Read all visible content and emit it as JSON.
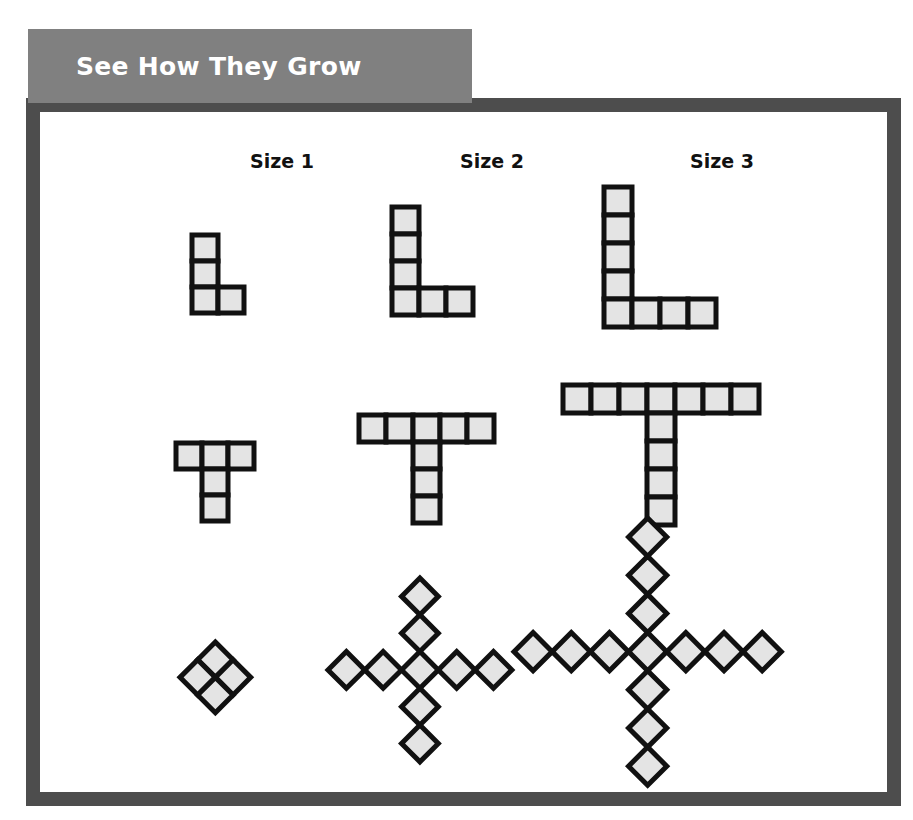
{
  "banner": {
    "title": "See How They Grow",
    "bg_color": "#808080",
    "text_color": "#ffffff"
  },
  "frame": {
    "border_color": "#4d4d4d",
    "background": "#ffffff"
  },
  "columns": [
    {
      "label": "Size 1",
      "center_x": 222
    },
    {
      "label": "Size 2",
      "center_x": 432
    },
    {
      "label": "Size 3",
      "center_x": 662
    }
  ],
  "style": {
    "cell_fill": "#e4e4e4",
    "cell_stroke": "#111111"
  },
  "chart_data": {
    "type": "diagram",
    "title": "See How They Grow",
    "columns": [
      "Size 1",
      "Size 2",
      "Size 3"
    ],
    "rows": [
      {
        "name": "L-shape",
        "rule": "vertical arm of (size+2) squares, horizontal base of (size+1) squares, sharing the corner square",
        "figures": [
          {
            "size": 1,
            "vertical_arm": 3,
            "horizontal_arm": 2,
            "total_cells": 4
          },
          {
            "size": 2,
            "vertical_arm": 4,
            "horizontal_arm": 3,
            "total_cells": 6
          },
          {
            "size": 3,
            "vertical_arm": 5,
            "horizontal_arm": 4,
            "total_cells": 8
          }
        ]
      },
      {
        "name": "T-shape",
        "rule": "top bar of (2*size+1) squares with a stem of (size+1) squares hanging from the center",
        "figures": [
          {
            "size": 1,
            "top_bar": 3,
            "stem": 2,
            "total_cells": 5
          },
          {
            "size": 2,
            "top_bar": 5,
            "stem": 3,
            "total_cells": 8
          },
          {
            "size": 3,
            "top_bar": 7,
            "stem": 4,
            "total_cells": 11
          }
        ]
      },
      {
        "name": "X-shape",
        "rule": "diagonal cross of tilted squares; size 1 is a 2x2 block, larger sizes are a center square with four arms of (size) squares",
        "figures": [
          {
            "size": 1,
            "arms": 0,
            "total_cells": 4
          },
          {
            "size": 2,
            "arms": 2,
            "total_cells": 9
          },
          {
            "size": 3,
            "arms": 3,
            "total_cells": 13
          }
        ]
      }
    ]
  },
  "shapes": {
    "l_shapes": [
      {
        "name": "l-shape-size-1",
        "origin_x": 192,
        "origin_y": 235,
        "cell": 26,
        "cells": [
          [
            0,
            0
          ],
          [
            0,
            1
          ],
          [
            0,
            2
          ],
          [
            1,
            2
          ]
        ]
      },
      {
        "name": "l-shape-size-2",
        "origin_x": 392,
        "origin_y": 207,
        "cell": 27,
        "cells": [
          [
            0,
            0
          ],
          [
            0,
            1
          ],
          [
            0,
            2
          ],
          [
            0,
            3
          ],
          [
            1,
            3
          ],
          [
            2,
            3
          ]
        ]
      },
      {
        "name": "l-shape-size-3",
        "origin_x": 604,
        "origin_y": 187,
        "cell": 28,
        "cells": [
          [
            0,
            0
          ],
          [
            0,
            1
          ],
          [
            0,
            2
          ],
          [
            0,
            3
          ],
          [
            0,
            4
          ],
          [
            1,
            4
          ],
          [
            2,
            4
          ],
          [
            3,
            4
          ]
        ]
      }
    ],
    "t_shapes": [
      {
        "name": "t-shape-size-1",
        "origin_x": 176,
        "origin_y": 443,
        "cell": 26,
        "cells": [
          [
            0,
            0
          ],
          [
            1,
            0
          ],
          [
            2,
            0
          ],
          [
            1,
            1
          ],
          [
            1,
            2
          ]
        ]
      },
      {
        "name": "t-shape-size-2",
        "origin_x": 359,
        "origin_y": 415,
        "cell": 27,
        "cells": [
          [
            0,
            0
          ],
          [
            1,
            0
          ],
          [
            2,
            0
          ],
          [
            3,
            0
          ],
          [
            4,
            0
          ],
          [
            2,
            1
          ],
          [
            2,
            2
          ],
          [
            2,
            3
          ]
        ]
      },
      {
        "name": "t-shape-size-3",
        "origin_x": 563,
        "origin_y": 385,
        "cell": 28,
        "cells": [
          [
            0,
            0
          ],
          [
            1,
            0
          ],
          [
            2,
            0
          ],
          [
            3,
            0
          ],
          [
            4,
            0
          ],
          [
            5,
            0
          ],
          [
            6,
            0
          ],
          [
            3,
            1
          ],
          [
            3,
            2
          ],
          [
            3,
            3
          ],
          [
            3,
            4
          ]
        ]
      }
    ],
    "x_shapes": [
      {
        "name": "x-shape-size-1",
        "center_x": 215,
        "center_y": 677,
        "cell": 25,
        "cells": [
          [
            -1,
            -1
          ],
          [
            0,
            -1
          ],
          [
            -1,
            0
          ],
          [
            0,
            0
          ]
        ]
      },
      {
        "name": "x-shape-size-2",
        "center_x": 420,
        "center_y": 670,
        "cell": 26,
        "cells": [
          [
            0,
            0
          ],
          [
            -1,
            -1
          ],
          [
            -2,
            -2
          ],
          [
            1,
            -1
          ],
          [
            2,
            -2
          ],
          [
            -1,
            1
          ],
          [
            -2,
            2
          ],
          [
            1,
            1
          ],
          [
            2,
            2
          ]
        ]
      },
      {
        "name": "x-shape-size-3",
        "center_x": 648,
        "center_y": 652,
        "cell": 27,
        "cells": [
          [
            0,
            0
          ],
          [
            -1,
            -1
          ],
          [
            -2,
            -2
          ],
          [
            -3,
            -3
          ],
          [
            1,
            -1
          ],
          [
            2,
            -2
          ],
          [
            3,
            -3
          ],
          [
            -1,
            1
          ],
          [
            -2,
            2
          ],
          [
            -3,
            3
          ],
          [
            1,
            1
          ],
          [
            2,
            2
          ],
          [
            3,
            3
          ]
        ]
      }
    ]
  }
}
